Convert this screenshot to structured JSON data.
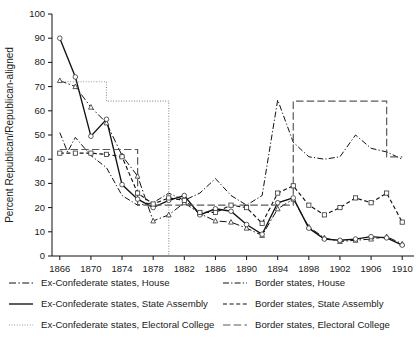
{
  "chart_data": {
    "type": "line",
    "title": "",
    "xlabel": "",
    "ylabel": "Percent Republican/Republican-aligned",
    "xlim": [
      1865,
      1911
    ],
    "ylim": [
      0,
      100
    ],
    "grid": false,
    "legend_position": "below",
    "ytick_labels": [
      "0",
      "10",
      "20",
      "30",
      "40",
      "50",
      "60",
      "70",
      "80",
      "90",
      "100"
    ],
    "ytick_values": [
      0,
      10,
      20,
      30,
      40,
      50,
      60,
      70,
      80,
      90,
      100
    ],
    "xtick_labels": [
      "1866",
      "1870",
      "1874",
      "1878",
      "1882",
      "1886",
      "1890",
      "1894",
      "1898",
      "1902",
      "1906",
      "1910"
    ],
    "xtick_values": [
      1866,
      1870,
      1874,
      1878,
      1882,
      1886,
      1890,
      1894,
      1898,
      1902,
      1906,
      1910
    ],
    "series": [
      {
        "name": "Ex-Confederate states, House",
        "key": "exc-house",
        "style": "dash-dot",
        "color": "#111111",
        "marker": "triangle",
        "x": [
          1866,
          1868,
          1870,
          1872,
          1874,
          1876,
          1878,
          1880,
          1882,
          1884,
          1886,
          1888,
          1890,
          1892,
          1894,
          1896,
          1898,
          1900,
          1902,
          1904,
          1906,
          1908,
          1910
        ],
        "y": [
          72.5,
          70.0,
          61.5,
          55.0,
          41.5,
          33.0,
          14.5,
          17.0,
          22.0,
          17.5,
          14.5,
          14.0,
          11.5,
          8.5,
          19.5,
          23.5,
          12.0,
          7.5,
          6.0,
          6.5,
          7.0,
          8.0,
          5.0
        ]
      },
      {
        "name": "Ex-Confederate states, State Assembly",
        "key": "exc-assembly",
        "style": "solid",
        "color": "#111111",
        "marker": "circle",
        "x": [
          1866,
          1868,
          1870,
          1872,
          1874,
          1876,
          1878,
          1880,
          1882,
          1884,
          1886,
          1888,
          1890,
          1892,
          1894,
          1896,
          1898,
          1900,
          1902,
          1904,
          1906,
          1908,
          1910
        ],
        "y": [
          90.0,
          74.0,
          49.5,
          56.5,
          29.5,
          23.5,
          20.0,
          23.0,
          25.0,
          17.0,
          19.5,
          18.5,
          13.0,
          9.0,
          22.0,
          24.0,
          11.5,
          7.0,
          6.5,
          7.0,
          8.0,
          7.5,
          4.5
        ]
      },
      {
        "name": "Ex-Confederate states, Electoral College",
        "key": "exc-ec",
        "style": "dotted",
        "color": "#8d8d8d",
        "marker": "none",
        "x": [
          1866,
          1868,
          1872,
          1876,
          1880,
          1884,
          1888,
          1892,
          1896,
          1900,
          1904,
          1908,
          1910
        ],
        "y": [
          72.0,
          72.0,
          64.0,
          64.0,
          0.0,
          0.0,
          0.0,
          0.0,
          0.0,
          0.0,
          0.0,
          0.0,
          0.0
        ]
      },
      {
        "name": "Border states, House",
        "key": "bor-house",
        "style": "dash-dot",
        "color": "#111111",
        "marker": "none",
        "x": [
          1866,
          1867,
          1868,
          1870,
          1872,
          1874,
          1876,
          1878,
          1880,
          1882,
          1884,
          1886,
          1888,
          1890,
          1892,
          1894,
          1896,
          1898,
          1900,
          1902,
          1904,
          1906,
          1908,
          1910
        ],
        "y": [
          51.0,
          43.0,
          49.0,
          41.5,
          36.5,
          25.0,
          21.0,
          22.0,
          26.0,
          23.0,
          26.0,
          32.0,
          25.0,
          21.0,
          25.0,
          64.5,
          47.0,
          41.0,
          40.0,
          41.0,
          50.0,
          44.5,
          43.0,
          40.0
        ]
      },
      {
        "name": "Border states, State Assembly",
        "key": "bor-assembly",
        "style": "short-dash",
        "color": "#111111",
        "marker": "square",
        "x": [
          1866,
          1868,
          1870,
          1872,
          1874,
          1876,
          1878,
          1880,
          1882,
          1884,
          1886,
          1888,
          1890,
          1892,
          1894,
          1896,
          1898,
          1900,
          1902,
          1904,
          1906,
          1908,
          1910
        ],
        "y": [
          42.5,
          42.5,
          42.5,
          42.0,
          41.0,
          26.0,
          21.5,
          24.0,
          23.0,
          18.0,
          18.0,
          21.0,
          20.0,
          13.5,
          26.0,
          29.0,
          21.0,
          17.0,
          20.0,
          24.0,
          22.0,
          26.0,
          14.0
        ]
      },
      {
        "name": "Border states, Electoral College",
        "key": "bor-ec",
        "style": "long-dash",
        "color": "#5a5a5a",
        "marker": "none",
        "x": [
          1866,
          1868,
          1872,
          1876,
          1880,
          1884,
          1888,
          1892,
          1896,
          1900,
          1904,
          1908,
          1910
        ],
        "y": [
          44.0,
          44.0,
          44.0,
          21.0,
          21.0,
          21.0,
          21.0,
          21.0,
          64.0,
          64.0,
          64.0,
          41.0,
          41.0
        ]
      }
    ]
  },
  "legend": {
    "left_column": [
      {
        "label": "Ex-Confederate states, House",
        "key": "exc-house"
      },
      {
        "label": "Ex-Confederate states, State Assembly",
        "key": "exc-assembly"
      },
      {
        "label": "Ex-Confederate states, Electoral College",
        "key": "exc-ec"
      }
    ],
    "right_column": [
      {
        "label": "Border states, House",
        "key": "bor-house"
      },
      {
        "label": "Border states, State Assembly",
        "key": "bor-assembly"
      },
      {
        "label": "Border states, Electoral College",
        "key": "bor-ec"
      }
    ]
  }
}
